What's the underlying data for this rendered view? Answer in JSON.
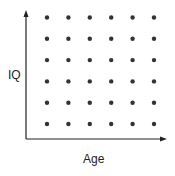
{
  "chart_data": {
    "type": "scatter",
    "title": "",
    "xlabel": "Age",
    "ylabel": "IQ",
    "x_ticks": [],
    "y_ticks": [],
    "grid": false,
    "legend": null,
    "points_description": "Uniform 6x6 grid of points showing no relationship between Age and IQ",
    "x": [
      1,
      2,
      3,
      4,
      5,
      6
    ],
    "y": [
      1,
      2,
      3,
      4,
      5,
      6
    ],
    "series": [
      {
        "name": "observations",
        "points": [
          [
            1,
            1
          ],
          [
            2,
            1
          ],
          [
            3,
            1
          ],
          [
            4,
            1
          ],
          [
            5,
            1
          ],
          [
            6,
            1
          ],
          [
            1,
            2
          ],
          [
            2,
            2
          ],
          [
            3,
            2
          ],
          [
            4,
            2
          ],
          [
            5,
            2
          ],
          [
            6,
            2
          ],
          [
            1,
            3
          ],
          [
            2,
            3
          ],
          [
            3,
            3
          ],
          [
            4,
            3
          ],
          [
            5,
            3
          ],
          [
            6,
            3
          ],
          [
            1,
            4
          ],
          [
            2,
            4
          ],
          [
            3,
            4
          ],
          [
            4,
            4
          ],
          [
            5,
            4
          ],
          [
            6,
            4
          ],
          [
            1,
            5
          ],
          [
            2,
            5
          ],
          [
            3,
            5
          ],
          [
            4,
            5
          ],
          [
            5,
            5
          ],
          [
            6,
            5
          ],
          [
            1,
            6
          ],
          [
            2,
            6
          ],
          [
            3,
            6
          ],
          [
            4,
            6
          ],
          [
            5,
            6
          ],
          [
            6,
            6
          ]
        ]
      }
    ],
    "colors": {
      "points": "#333333",
      "axes": "#222222"
    }
  }
}
